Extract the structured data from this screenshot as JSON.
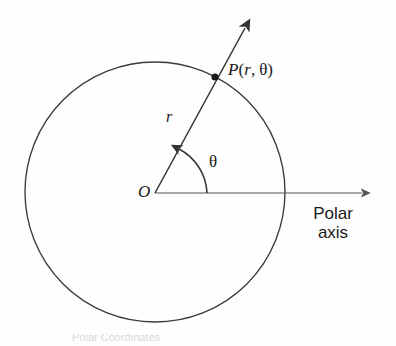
{
  "figure": {
    "kind": "polar-coordinate-diagram",
    "background_color": "#fefefe",
    "stroke_color": "#333333",
    "axis_color": "#555555",
    "text_color": "#1a1a1a"
  },
  "labels": {
    "origin": "O",
    "radius": "r",
    "angle": "θ",
    "point_name": "P",
    "point_open_paren": "(",
    "point_radius": "r",
    "point_separator": ",",
    "point_angle": "θ",
    "point_close_paren": ")",
    "polar_axis_line1": "Polar",
    "polar_axis_line2": "axis"
  },
  "geometry": {
    "circle": {
      "cx": 155,
      "cy": 192,
      "r": 130
    },
    "origin_point": {
      "x": 155,
      "y": 193
    },
    "point_p": {
      "x": 215,
      "y": 77
    },
    "ray_tip": {
      "x": 250,
      "y": 22
    },
    "axis_start": {
      "x": 155,
      "y": 193
    },
    "axis_tip": {
      "x": 368,
      "y": 193
    },
    "angle_arc_radius": 52,
    "angle_degrees": 62
  },
  "caption": {
    "clipped_text": "Polar Coordinates"
  }
}
